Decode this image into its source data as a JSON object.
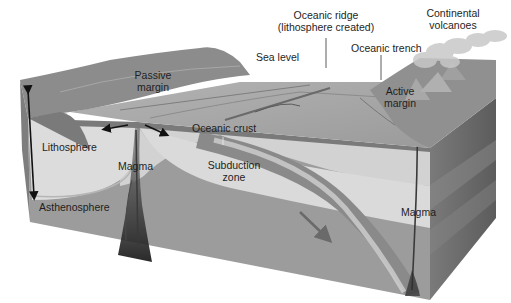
{
  "diagram": {
    "style": "grayscale",
    "labels": {
      "oceanic_ridge_line1": "Oceanic ridge",
      "oceanic_ridge_line2": "(lithosphere created)",
      "continental_volcanoes_line1": "Continental",
      "continental_volcanoes_line2": "volcanoes",
      "sea_level": "Sea level",
      "oceanic_trench": "Oceanic trench",
      "passive_margin_line1": "Passive",
      "passive_margin_line2": "margin",
      "active_margin_line1": "Active",
      "active_margin_line2": "margin",
      "oceanic_crust": "Oceanic crust",
      "lithosphere": "Lithosphere",
      "magma_ridge": "Magma",
      "subduction_zone_line1": "Subduction",
      "subduction_zone_line2": "zone",
      "asthenosphere": "Asthenosphere",
      "magma_volcano": "Magma"
    },
    "colors": {
      "sea_surface": "#a9a9a9",
      "continent_land": "#8e8e8e",
      "lithosphere": "#d8d8d8",
      "asthenosphere": "#9a9a9a",
      "oceanic_crust": "#7d7d7d",
      "side_face": "#6e6e6e",
      "magma": "#2a2a2a",
      "label_text": "#1e1e1e"
    }
  }
}
